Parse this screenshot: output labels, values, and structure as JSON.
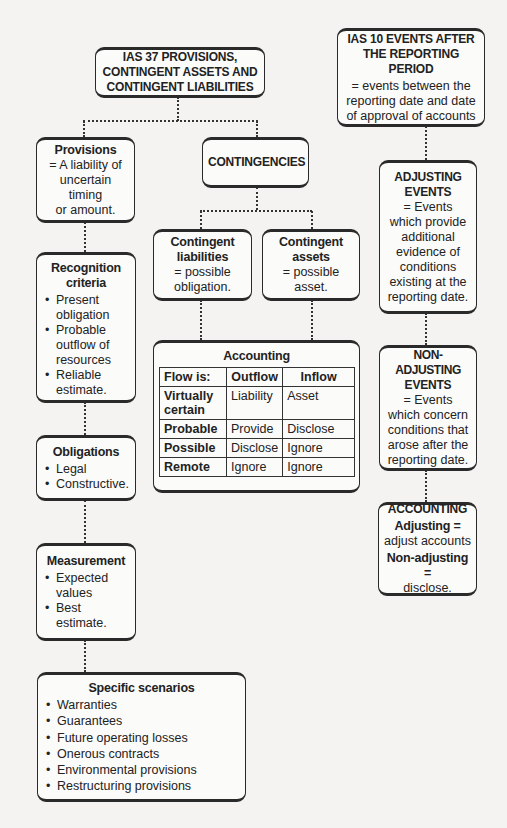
{
  "ias37": {
    "title_lines": [
      "IAS 37 PROVISIONS,",
      "CONTINGENT ASSETS AND",
      "CONTINGENT LIABILITIES"
    ]
  },
  "provisions": {
    "title": "Provisions",
    "description_lines": [
      "= A liability of",
      "uncertain timing",
      "or amount."
    ]
  },
  "recognition": {
    "title_lines": [
      "Recognition",
      "criteria"
    ],
    "items": [
      "Present obligation",
      "Probable outflow of resources",
      "Reliable estimate."
    ]
  },
  "obligations": {
    "title": "Obligations",
    "items": [
      "Legal",
      "Constructive."
    ]
  },
  "measurement": {
    "title": "Measurement",
    "items": [
      "Expected values",
      "Best estimate."
    ]
  },
  "specific_scenarios": {
    "title": "Specific scenarios",
    "items": [
      "Warranties",
      "Guarantees",
      "Future operating losses",
      "Onerous contracts",
      "Environmental provisions",
      "Restructuring provisions"
    ]
  },
  "contingencies": {
    "title": "CONTINGENCIES"
  },
  "contingent_liabilities": {
    "title_lines": [
      "Contingent",
      "liabilities"
    ],
    "description_lines": [
      "= possible",
      "obligation."
    ]
  },
  "contingent_assets": {
    "title_lines": [
      "Contingent",
      "assets"
    ],
    "description_lines": [
      "= possible",
      "asset."
    ]
  },
  "accounting_table": {
    "title": "Accounting",
    "headers": [
      "Flow is:",
      "Outflow",
      "Inflow"
    ],
    "rows": [
      {
        "label": "Virtually certain",
        "outflow": "Liability",
        "inflow": "Asset"
      },
      {
        "label": "Probable",
        "outflow": "Provide",
        "inflow": "Disclose"
      },
      {
        "label": "Possible",
        "outflow": "Disclose",
        "inflow": "Ignore"
      },
      {
        "label": "Remote",
        "outflow": "Ignore",
        "inflow": "Ignore"
      }
    ]
  },
  "ias10": {
    "title_lines": [
      "IAS 10 EVENTS AFTER",
      "THE REPORTING PERIOD"
    ],
    "description_lines": [
      "= events between the",
      "reporting date and date",
      "of approval of accounts"
    ]
  },
  "adjusting_events": {
    "title_lines": [
      "ADJUSTING",
      "EVENTS"
    ],
    "description_lines": [
      "= Events",
      "which provide",
      "additional",
      "evidence of",
      "conditions",
      "existing at the",
      "reporting date."
    ]
  },
  "non_adjusting_events": {
    "title_lines": [
      "NON-ADJUSTING",
      "EVENTS"
    ],
    "description_lines": [
      "= Events",
      "which concern",
      "conditions that",
      "arose after the",
      "reporting date."
    ]
  },
  "accounting_ias10": {
    "title": "ACCOUNTING",
    "adjusting_label": "Adjusting =",
    "adjusting_value": "adjust accounts",
    "non_adjusting_label": "Non-adjusting =",
    "non_adjusting_value": "disclose."
  }
}
